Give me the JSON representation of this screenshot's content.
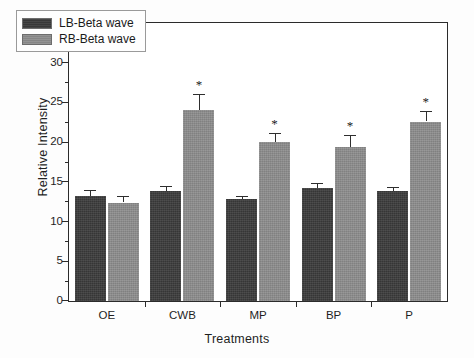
{
  "chart_data": {
    "type": "bar",
    "title": "",
    "xlabel": "Treatments",
    "ylabel": "Relative Intensity",
    "categories": [
      "OE",
      "CWB",
      "MP",
      "BP",
      "P"
    ],
    "ylim": [
      0,
      35
    ],
    "yticks": [
      0,
      5,
      10,
      15,
      20,
      25,
      30,
      35
    ],
    "ytick_labels": [
      "0",
      "5",
      "10",
      "15",
      "20",
      "25",
      "30",
      "35"
    ],
    "minor_ticks": true,
    "grid": false,
    "legend_position": "top-left",
    "series": [
      {
        "name": "LB-Beta wave",
        "color": "#3b3b3b",
        "values": [
          13.2,
          13.9,
          12.8,
          14.2,
          13.8
        ],
        "errors": [
          0.8,
          0.6,
          0.4,
          0.7,
          0.5
        ],
        "significance": [
          "",
          "",
          "",
          "",
          ""
        ]
      },
      {
        "name": "RB-Beta wave",
        "color": "#8d8d8d",
        "values": [
          12.4,
          24.0,
          20.0,
          19.4,
          22.6
        ],
        "errors": [
          0.8,
          2.0,
          1.1,
          1.5,
          1.3
        ],
        "significance": [
          "",
          "*",
          "*",
          "*",
          "*"
        ]
      }
    ],
    "significance_marker": "*"
  },
  "legend": {
    "items": [
      {
        "label": "LB-Beta wave",
        "swatch": "dark"
      },
      {
        "label": "RB-Beta wave",
        "swatch": "light"
      }
    ]
  },
  "axes": {
    "y_axis_label": "Relative Intensity",
    "x_axis_label": "Treatments"
  }
}
